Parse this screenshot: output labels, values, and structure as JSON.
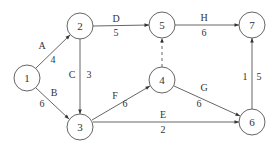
{
  "diagram": {
    "type": "activity-network",
    "nodes": [
      {
        "id": "1",
        "label": "1",
        "cx": 27,
        "cy": 78
      },
      {
        "id": "2",
        "label": "2",
        "cx": 80,
        "cy": 26
      },
      {
        "id": "3",
        "label": "3",
        "cx": 80,
        "cy": 127
      },
      {
        "id": "4",
        "label": "4",
        "cx": 162,
        "cy": 80
      },
      {
        "id": "5",
        "label": "5",
        "cx": 162,
        "cy": 25
      },
      {
        "id": "6",
        "label": "6",
        "cx": 252,
        "cy": 122
      },
      {
        "id": "7",
        "label": "7",
        "cx": 252,
        "cy": 25
      }
    ],
    "edges": [
      {
        "from": "1",
        "to": "2",
        "activity": "A",
        "duration": "4",
        "style": "solid"
      },
      {
        "from": "1",
        "to": "3",
        "activity": "B",
        "duration": "6",
        "style": "solid"
      },
      {
        "from": "2",
        "to": "3",
        "activity": "C",
        "duration": "3",
        "style": "solid"
      },
      {
        "from": "2",
        "to": "5",
        "activity": "D",
        "duration": "5",
        "style": "solid"
      },
      {
        "from": "3",
        "to": "6",
        "activity": "E",
        "duration": "2",
        "style": "solid"
      },
      {
        "from": "3",
        "to": "4",
        "activity": "F",
        "duration": "6",
        "style": "solid"
      },
      {
        "from": "4",
        "to": "6",
        "activity": "G",
        "duration": "6",
        "style": "solid"
      },
      {
        "from": "5",
        "to": "7",
        "activity": "H",
        "duration": "6",
        "style": "solid"
      },
      {
        "from": "4",
        "to": "5",
        "activity": "",
        "duration": "",
        "style": "dashed"
      },
      {
        "from": "6",
        "to": "7",
        "activity": "1",
        "duration": "5",
        "style": "solid"
      }
    ]
  },
  "labels": {
    "n1": "1",
    "n2": "2",
    "n3": "3",
    "n4": "4",
    "n5": "5",
    "n6": "6",
    "n7": "7",
    "A": "A",
    "A_d": "4",
    "B": "B",
    "B_d": "6",
    "C": "C",
    "C_d": "3",
    "D": "D",
    "D_d": "5",
    "E": "E",
    "E_d": "2",
    "F": "F",
    "F_d": "6",
    "G": "G",
    "G_d": "6",
    "H": "H",
    "H_d": "6",
    "I": "1",
    "I_d": "5"
  },
  "colors": {
    "stroke": "#444444",
    "text": "#333333",
    "background": "#ffffff"
  }
}
